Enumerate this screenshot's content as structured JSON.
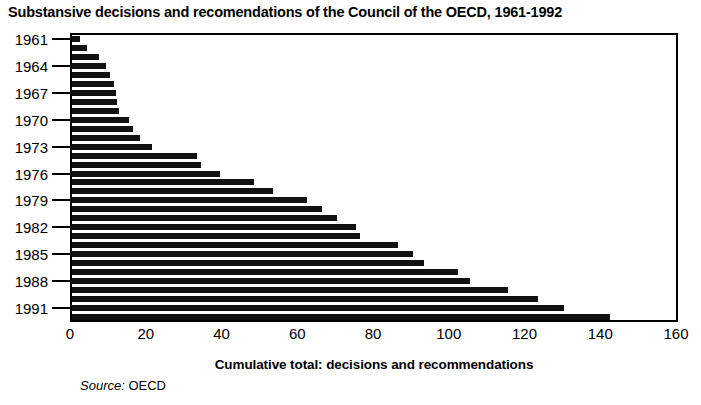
{
  "chart_data": {
    "type": "bar",
    "orientation": "horizontal",
    "title": "Substansive decisions and recomendations of the Council of the OECD, 1961-1992",
    "subtitle": "",
    "xlabel": "Cumulative total: decisions and recommendations",
    "ylabel": "",
    "xlim": [
      0,
      160
    ],
    "xticks": [
      0,
      20,
      40,
      60,
      80,
      100,
      120,
      140,
      160
    ],
    "xtick_labels": [
      "0",
      "20",
      "40",
      "60",
      "80",
      "100",
      "120",
      "140",
      "160"
    ],
    "ytick_labels": [
      "1961",
      "1964",
      "1967",
      "1970",
      "1973",
      "1976",
      "1979",
      "1982",
      "1985",
      "1988",
      "1991"
    ],
    "grid": false,
    "legend": null,
    "bar_color": "#111111",
    "frame_color": "#000000",
    "background": "#ffffff",
    "categories": [
      "1961",
      "1962",
      "1963",
      "1964",
      "1965",
      "1966",
      "1967",
      "1968",
      "1969",
      "1970",
      "1971",
      "1972",
      "1973",
      "1974",
      "1975",
      "1976",
      "1977",
      "1978",
      "1979",
      "1980",
      "1981",
      "1982",
      "1983",
      "1984",
      "1985",
      "1986",
      "1987",
      "1988",
      "1989",
      "1990",
      "1991",
      "1992"
    ],
    "values": [
      2,
      4,
      7,
      9,
      10,
      11,
      11.5,
      12,
      12.5,
      15,
      16,
      18,
      21,
      33,
      34,
      39,
      48,
      53,
      62,
      66,
      70,
      75,
      76,
      86,
      90,
      93,
      102,
      105,
      115,
      123,
      130,
      142
    ],
    "annotations": []
  },
  "source": {
    "label": "Source:",
    "value": " OECD"
  }
}
